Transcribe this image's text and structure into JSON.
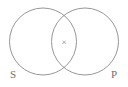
{
  "figure": {
    "type": "venn-diagram",
    "background_color": "#ffffff",
    "stroke_color": "#8a8a8a",
    "stroke_width": 0.9,
    "width": 128,
    "height": 87,
    "circles": [
      {
        "id": "left-circle",
        "name": "S",
        "cx": 43,
        "cy": 41.5,
        "r": 33.5
      },
      {
        "id": "right-circle",
        "name": "P",
        "cx": 85,
        "cy": 41.5,
        "r": 33.5
      }
    ],
    "labels": [
      {
        "id": "label-s",
        "text": "S",
        "x": 13,
        "y": 78,
        "color": "#6f6f6f",
        "font_size": 11
      },
      {
        "id": "label-p",
        "text": "P",
        "x": 112,
        "y": 78,
        "color": "#6f6f6f",
        "font_size": 11
      }
    ],
    "marks": [
      {
        "id": "intersection-mark",
        "text": "×",
        "x": 64,
        "y": 44,
        "region": "S ∩ P",
        "color": "#7a7a7a",
        "font_size": 9
      }
    ]
  }
}
